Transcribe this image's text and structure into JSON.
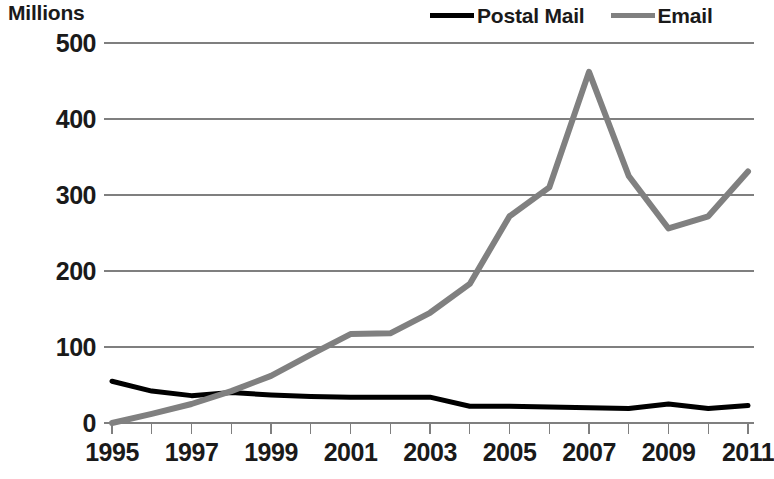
{
  "chart_data": {
    "type": "line",
    "title": "",
    "ylabel": "Millions",
    "xlabel": "",
    "ylim": [
      0,
      500
    ],
    "ytick_step": 100,
    "yticks": [
      0,
      100,
      200,
      300,
      400,
      500
    ],
    "ytick_labels": [
      "0",
      "100",
      "200",
      "300",
      "400",
      "500"
    ],
    "grid": "horizontal",
    "legend_position": "top-right",
    "x": [
      1995,
      1996,
      1997,
      1998,
      1999,
      2000,
      2001,
      2002,
      2003,
      2004,
      2005,
      2006,
      2007,
      2008,
      2009,
      2010,
      2011
    ],
    "xtick_labels": [
      "1995",
      "1997",
      "1999",
      "2001",
      "2003",
      "2005",
      "2007",
      "2009",
      "2011"
    ],
    "xticks": [
      1995,
      1997,
      1999,
      2001,
      2003,
      2005,
      2007,
      2009,
      2011
    ],
    "series": [
      {
        "name": "Postal Mail",
        "color": "#000000",
        "values": [
          55,
          42,
          36,
          40,
          37,
          35,
          34,
          34,
          34,
          22,
          22,
          21,
          20,
          19,
          25,
          19,
          23
        ]
      },
      {
        "name": "Email",
        "color": "#808080",
        "values": [
          0,
          12,
          25,
          42,
          62,
          90,
          117,
          118,
          145,
          183,
          272,
          310,
          462,
          325,
          256,
          272,
          331
        ]
      }
    ]
  },
  "legend": {
    "entries": [
      {
        "label": "Postal Mail",
        "color": "#000000"
      },
      {
        "label": "Email",
        "color": "#808080"
      }
    ]
  },
  "axis": {
    "y_title": "Millions"
  },
  "colors": {
    "postal_mail": "#000000",
    "email": "#808080",
    "gridline": "#7f7f7f",
    "text": "#1a1a1a",
    "background": "#ffffff"
  }
}
